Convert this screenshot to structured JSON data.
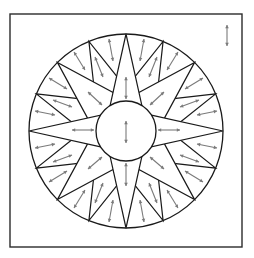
{
  "diagram": {
    "colors": {
      "line": "#1a1a1a",
      "frame": "#2b2b2b",
      "arrow": "#7a7a7a",
      "background": "#ffffff"
    },
    "frame": {
      "x": 10,
      "y": 14,
      "width": 232,
      "height": 233
    },
    "center": {
      "x": 126,
      "y": 131
    },
    "outer_radius": 97,
    "inner_radius": 30,
    "star_layers": [
      {
        "name": "minor-points",
        "count": 8,
        "start_angle_deg": -67.5,
        "step_deg": 45,
        "base_radius": 52,
        "base_half_angle_deg": 15
      },
      {
        "name": "diagonal-points",
        "count": 4,
        "start_angle_deg": -45,
        "step_deg": 90,
        "base_radius": 34,
        "base_half_angle_deg": 38
      },
      {
        "name": "cardinal-points",
        "count": 4,
        "start_angle_deg": -90,
        "step_deg": 90,
        "base_radius": 30,
        "base_half_angle_deg": 32
      }
    ],
    "arrows": [
      {
        "x1": 227,
        "y1": 25,
        "x2": 227,
        "y2": 46,
        "label": "corner-grainline"
      },
      {
        "x1": 126,
        "y1": 121,
        "x2": 126,
        "y2": 143,
        "label": "center-grainline"
      },
      {
        "x1": 126,
        "y1": 77,
        "x2": 126,
        "y2": 99
      },
      {
        "x1": 126,
        "y1": 163,
        "x2": 126,
        "y2": 186
      },
      {
        "x1": 72,
        "y1": 130,
        "x2": 94,
        "y2": 130
      },
      {
        "x1": 158,
        "y1": 130,
        "x2": 180,
        "y2": 130
      },
      {
        "x1": 109,
        "y1": 39,
        "x2": 113,
        "y2": 61
      },
      {
        "x1": 144,
        "y1": 39,
        "x2": 140,
        "y2": 61
      },
      {
        "x1": 95,
        "y1": 57,
        "x2": 103,
        "y2": 77
      },
      {
        "x1": 157,
        "y1": 57,
        "x2": 149,
        "y2": 77
      },
      {
        "x1": 74,
        "y1": 52,
        "x2": 85,
        "y2": 70
      },
      {
        "x1": 178,
        "y1": 52,
        "x2": 167,
        "y2": 70
      },
      {
        "x1": 88,
        "y1": 92,
        "x2": 102,
        "y2": 105
      },
      {
        "x1": 164,
        "y1": 92,
        "x2": 150,
        "y2": 105
      },
      {
        "x1": 49,
        "y1": 78,
        "x2": 67,
        "y2": 89
      },
      {
        "x1": 203,
        "y1": 78,
        "x2": 185,
        "y2": 89
      },
      {
        "x1": 53,
        "y1": 100,
        "x2": 72,
        "y2": 107
      },
      {
        "x1": 199,
        "y1": 100,
        "x2": 180,
        "y2": 107
      },
      {
        "x1": 35,
        "y1": 111,
        "x2": 55,
        "y2": 115
      },
      {
        "x1": 217,
        "y1": 111,
        "x2": 197,
        "y2": 115
      },
      {
        "x1": 35,
        "y1": 148,
        "x2": 55,
        "y2": 144
      },
      {
        "x1": 217,
        "y1": 148,
        "x2": 197,
        "y2": 144
      },
      {
        "x1": 53,
        "y1": 162,
        "x2": 72,
        "y2": 155
      },
      {
        "x1": 199,
        "y1": 162,
        "x2": 180,
        "y2": 155
      },
      {
        "x1": 49,
        "y1": 182,
        "x2": 67,
        "y2": 171
      },
      {
        "x1": 203,
        "y1": 182,
        "x2": 185,
        "y2": 171
      },
      {
        "x1": 88,
        "y1": 169,
        "x2": 102,
        "y2": 157
      },
      {
        "x1": 164,
        "y1": 169,
        "x2": 150,
        "y2": 157
      },
      {
        "x1": 74,
        "y1": 208,
        "x2": 85,
        "y2": 190
      },
      {
        "x1": 178,
        "y1": 208,
        "x2": 167,
        "y2": 190
      },
      {
        "x1": 95,
        "y1": 203,
        "x2": 103,
        "y2": 183
      },
      {
        "x1": 157,
        "y1": 203,
        "x2": 149,
        "y2": 183
      },
      {
        "x1": 109,
        "y1": 222,
        "x2": 113,
        "y2": 200
      },
      {
        "x1": 144,
        "y1": 222,
        "x2": 140,
        "y2": 200
      }
    ]
  }
}
